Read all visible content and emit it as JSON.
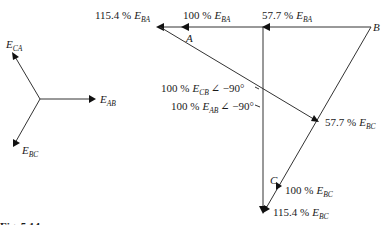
{
  "diagram": {
    "type": "phasor-diagram",
    "reference_phasors": {
      "e_ca": {
        "base": "E",
        "sub": "CA"
      },
      "e_ab": {
        "base": "E",
        "sub": "AB"
      },
      "e_bc": {
        "base": "E",
        "sub": "BC"
      }
    },
    "points": {
      "a": "A",
      "b": "B",
      "c": "C"
    },
    "labels": {
      "top_left": {
        "pct": "115.4 %",
        "base": "E",
        "sub": "BA"
      },
      "top_mid": {
        "pct": "100 %",
        "base": "E",
        "sub": "BA"
      },
      "top_right": {
        "pct": "57.7 %",
        "base": "E",
        "sub": "BA"
      },
      "cb_rot": {
        "pct": "100 %",
        "base": "E",
        "sub": "CB",
        "angle": "∠ −90°"
      },
      "ab_rot": {
        "pct": "100 %",
        "base": "E",
        "sub": "AB",
        "angle": "∠ −90°"
      },
      "mid_bc": {
        "pct": "57.7 %",
        "base": "E",
        "sub": "BC"
      },
      "c_bc": {
        "pct": "100 %",
        "base": "E",
        "sub": "BC"
      },
      "bottom_bc": {
        "pct": "115.4 %",
        "base": "E",
        "sub": "BC"
      }
    },
    "caption_fragment": "Fig. 5.14"
  }
}
